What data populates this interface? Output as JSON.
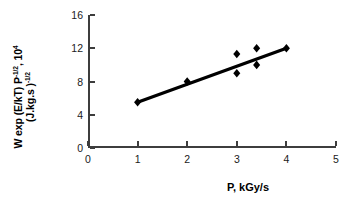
{
  "chart_data": {
    "type": "scatter",
    "title": "",
    "xlabel": "P, kGy/s",
    "ylabel_line1": "W exp (E/kT) P-1/2, 104",
    "ylabel_line2": "(J.kg.s )-1/2",
    "xlim": [
      0,
      5
    ],
    "ylim": [
      0,
      16
    ],
    "xticks": [
      0,
      1,
      2,
      3,
      4,
      5
    ],
    "yticks": [
      0,
      4,
      8,
      12,
      16
    ],
    "grid": false,
    "legend": "none",
    "marker": "diamond",
    "marker_color": "#000000",
    "line_color": "#000000",
    "points": [
      {
        "x": 1.0,
        "y": 5.5
      },
      {
        "x": 2.0,
        "y": 8.0
      },
      {
        "x": 3.0,
        "y": 11.3
      },
      {
        "x": 3.0,
        "y": 9.0
      },
      {
        "x": 3.4,
        "y": 12.0
      },
      {
        "x": 3.4,
        "y": 10.0
      },
      {
        "x": 4.0,
        "y": 12.0
      }
    ],
    "trendline": {
      "x": [
        1.0,
        4.0
      ],
      "y": [
        5.5,
        12.0
      ]
    }
  },
  "axis": {
    "ylabel": {
      "line1": {
        "pre": "W exp (E/kT) P",
        "sup1": "-1/2",
        "mid": ", 10",
        "sup2": "4"
      },
      "line2": {
        "pre": "(J.kg.s )",
        "sup1": "-1/2"
      }
    },
    "xlabel": "P, kGy/s",
    "ytick_labels": [
      "0",
      "4",
      "8",
      "12",
      "16"
    ],
    "xtick_labels": [
      "0",
      "1",
      "2",
      "3",
      "4",
      "5"
    ]
  }
}
